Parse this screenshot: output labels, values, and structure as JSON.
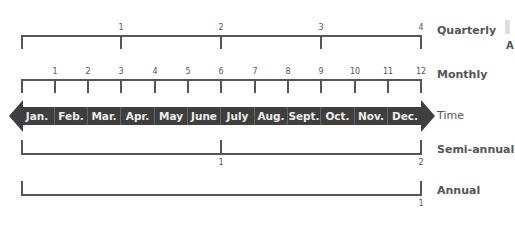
{
  "rows": {
    "quarterly": {
      "label": "Quarterly",
      "ticks": [
        "1",
        "2",
        "3",
        "4"
      ]
    },
    "monthly": {
      "label": "Monthly",
      "ticks": [
        "1",
        "2",
        "3",
        "4",
        "5",
        "6",
        "7",
        "8",
        "9",
        "10",
        "11",
        "12"
      ]
    },
    "time": {
      "label": "Time",
      "months": [
        "Jan.",
        "Feb.",
        "Mar.",
        "Apr.",
        "May",
        "June",
        "July",
        "Aug.",
        "Sept.",
        "Oct.",
        "Nov.",
        "Dec."
      ]
    },
    "semiannual": {
      "label": "Semi-annual",
      "ticks": [
        "1",
        "2"
      ]
    },
    "annual": {
      "label": "Annual",
      "ticks": [
        "1"
      ]
    }
  },
  "edge_fragment": {
    "text": "A"
  },
  "colors": {
    "line": "#555555",
    "band": "#3f3f3f",
    "band_text": "#eeeeee"
  }
}
